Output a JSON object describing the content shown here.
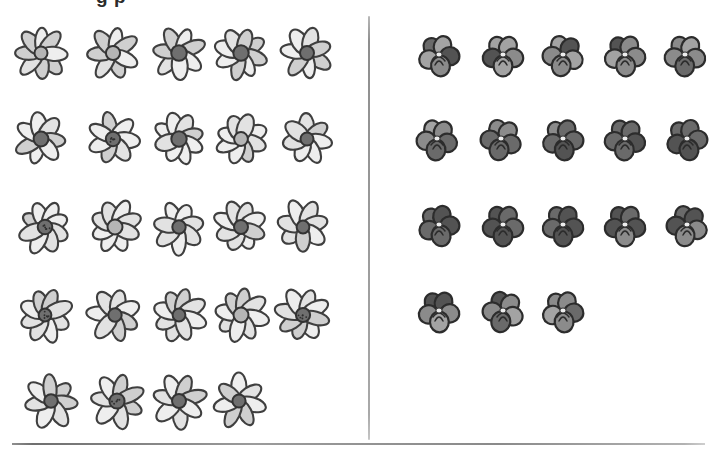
{
  "page": {
    "title_clipped": "g  p",
    "background_color": "#ffffff",
    "divider_color": "#9a9a9a",
    "rule_color": "#8a8a8a"
  },
  "chart_data": {
    "type": "bar",
    "title": "",
    "xlabel": "",
    "ylabel": "",
    "categories": [
      "Daisies",
      "Pansies"
    ],
    "values": [
      24,
      18
    ],
    "ylim": [
      0,
      25
    ],
    "grid": false,
    "legend": "none",
    "series": [
      {
        "name": "Daisies",
        "icon": "daisy-icon",
        "total": 24,
        "rows": [
          5,
          5,
          5,
          5,
          4
        ]
      },
      {
        "name": "Pansies",
        "icon": "pansy-icon",
        "total": 18,
        "rows": [
          5,
          5,
          5,
          3
        ]
      }
    ]
  },
  "groups": {
    "daisy": {
      "name": "Daisies",
      "icon": "daisy-icon",
      "count": 24,
      "rows": [
        {
          "count": 5,
          "top": 24,
          "x": [
            12,
            84,
            150,
            212,
            278
          ]
        },
        {
          "count": 5,
          "top": 110,
          "x": [
            12,
            84,
            150,
            212,
            278
          ]
        },
        {
          "count": 5,
          "top": 198,
          "x": [
            16,
            86,
            150,
            212,
            274
          ]
        },
        {
          "count": 5,
          "top": 286,
          "x": [
            16,
            86,
            150,
            212,
            274
          ]
        },
        {
          "count": 4,
          "top": 372,
          "x": [
            22,
            88,
            150,
            210
          ]
        }
      ]
    },
    "pansy": {
      "name": "Pansies",
      "icon": "pansy-icon",
      "count": 18,
      "rows": [
        {
          "count": 5,
          "top": 26,
          "x": [
            38,
            102,
            162,
            224,
            284
          ]
        },
        {
          "count": 5,
          "top": 110,
          "x": [
            36,
            100,
            162,
            224,
            286
          ]
        },
        {
          "count": 5,
          "top": 196,
          "x": [
            38,
            102,
            162,
            224,
            286
          ]
        },
        {
          "count": 3,
          "top": 282,
          "x": [
            38,
            102,
            162
          ]
        }
      ]
    }
  }
}
